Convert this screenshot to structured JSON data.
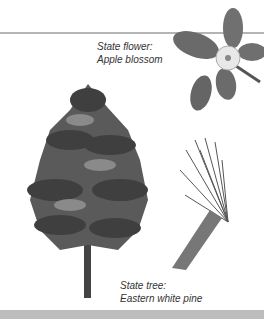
{
  "flower": {
    "label": "State flower:",
    "name": "Apple blossom"
  },
  "tree": {
    "label": "State tree:",
    "name": "Eastern white pine"
  }
}
